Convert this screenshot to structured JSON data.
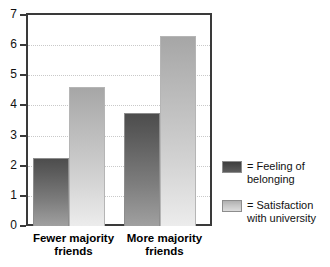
{
  "chart_data": {
    "type": "bar",
    "title": "",
    "xlabel": "",
    "ylabel": "",
    "ylim": [
      0,
      7
    ],
    "yticks": [
      0,
      1,
      2,
      3,
      4,
      5,
      6,
      7
    ],
    "ytick_labels": [
      "0",
      "1",
      "2",
      "3",
      "4",
      "5",
      "6",
      "7"
    ],
    "grid": true,
    "grid_style": "dotted-horizontal",
    "legend_position": "right",
    "categories": [
      "Fewer majority friends",
      "More majority friends"
    ],
    "category_lines": [
      [
        "Fewer majority",
        "friends"
      ],
      [
        "More majority",
        "friends"
      ]
    ],
    "series": [
      {
        "name": "Feeling of belonging",
        "legend_lines": [
          "= Feeling of",
          "belonging"
        ],
        "color": "#5a5a5a",
        "values": [
          2.25,
          3.75
        ]
      },
      {
        "name": "Satisfaction with university",
        "legend_lines": [
          "= Satisfaction",
          "with university"
        ],
        "color": "#c6c6c6",
        "values": [
          4.6,
          6.3
        ]
      }
    ]
  },
  "colors": {
    "axis": "#3a3a3a",
    "gridline": "#c9c9c9",
    "dark_bar_top": "#4d4d4d",
    "dark_bar_bottom": "#a0a0a0",
    "light_bar_top": "#a6a6a6",
    "light_bar_bottom": "#ececec",
    "background": "#ffffff"
  }
}
